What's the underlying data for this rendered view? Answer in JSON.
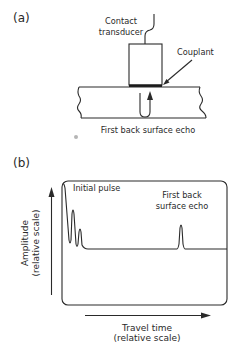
{
  "figure": {
    "panel_a": {
      "label": "(a)",
      "transducer_label_line1": "Contact",
      "transducer_label_line2": "transducer",
      "couplant_label": "Couplant",
      "echo_label": "First back surface echo"
    },
    "panel_b": {
      "label": "(b)",
      "initial_pulse_label": "Initial pulse",
      "back_echo_label_line1": "First back",
      "back_echo_label_line2": "surface echo",
      "y_axis_label_line1": "Amplitude",
      "y_axis_label_line2": "(relative scale)",
      "x_axis_label_line1": "Travel time",
      "x_axis_label_line2": "(relative scale)"
    }
  },
  "colors": {
    "ink": "#2a2a2a",
    "background": "#ffffff",
    "dot": "#b5b5b5"
  }
}
